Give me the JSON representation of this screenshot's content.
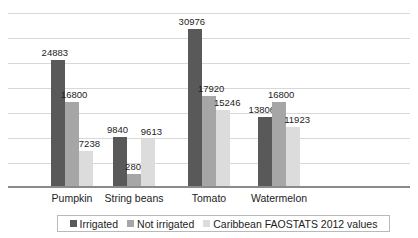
{
  "chart_data": {
    "type": "bar",
    "title": "",
    "xlabel": "",
    "ylabel": "",
    "categories": [
      "Pumpkin",
      "String beans",
      "Tomato",
      "Watermelon"
    ],
    "series": [
      {
        "name": "Irrigated",
        "color": "#595959",
        "values": [
          24883,
          9840,
          30976,
          13806
        ]
      },
      {
        "name": "Not irrigated",
        "color": "#a6a6a6",
        "values": [
          16800,
          2800,
          17920,
          16800
        ]
      },
      {
        "name": "Caribbean FAOSTATS 2012 values",
        "color": "#dcdcdc",
        "values": [
          7238,
          9613,
          15246,
          11923
        ]
      }
    ],
    "ylim": [
      0,
      35000
    ],
    "gridlines": [
      5000,
      10000,
      15000,
      20000,
      25000,
      30000,
      35000
    ],
    "grid": true,
    "y_tick_labels": [],
    "data_labels": true,
    "legend_position": "bottom"
  },
  "legend": {
    "items": [
      {
        "label": "Irrigated"
      },
      {
        "label": "Not irrigated"
      },
      {
        "label": "Caribbean FAOSTATS 2012 values"
      }
    ]
  }
}
